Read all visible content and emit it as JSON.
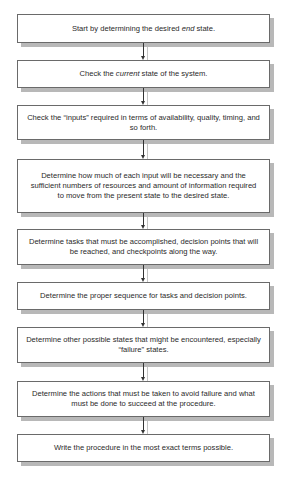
{
  "diagram": {
    "type": "flowchart",
    "direction": "top-to-bottom",
    "steps": [
      {
        "pre": "Start by determining the desired ",
        "em": "end",
        "post": " state."
      },
      {
        "pre": "Check the ",
        "em": "current",
        "post": " state of the system."
      },
      {
        "pre": "Check the “inputs” required in terms of availability, quality, timing, and so forth.",
        "em": "",
        "post": ""
      },
      {
        "pre": "Determine how much of each input will be necessary and the sufficient numbers of resources and amount of information required to move from the present state to the desired state.",
        "em": "",
        "post": ""
      },
      {
        "pre": "Determine tasks that must be accomplished, decision points that will be reached, and checkpoints along the way.",
        "em": "",
        "post": ""
      },
      {
        "pre": "Determine the proper sequence for tasks and decision points.",
        "em": "",
        "post": ""
      },
      {
        "pre": "Determine other possible states that might be encountered, especially “failure” states.",
        "em": "",
        "post": ""
      },
      {
        "pre": "Determine the actions that must be taken to avoid failure and what must be done to succeed at the procedure.",
        "em": "",
        "post": ""
      },
      {
        "pre": "Write the procedure in the most exact terms possible.",
        "em": "",
        "post": ""
      }
    ],
    "colors": {
      "border": "#6a6a6a",
      "shadow": "#b8b8b8",
      "arrow": "#333333",
      "text": "#2a2a2a"
    }
  }
}
